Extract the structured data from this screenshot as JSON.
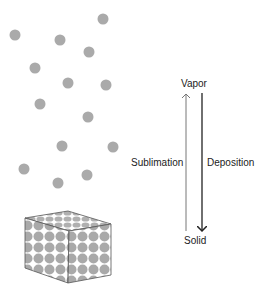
{
  "diagram": {
    "type": "phase-transition",
    "labels": {
      "top": "Vapor",
      "bottom": "Solid",
      "up_process": "Sublimation",
      "down_process": "Deposition"
    },
    "colors": {
      "particle": "#aaaaaa",
      "text": "#222222",
      "up_arrow": "#777777",
      "down_arrow": "#222222"
    },
    "vapor_particles": [
      [
        103,
        19
      ],
      [
        15,
        35
      ],
      [
        60,
        40
      ],
      [
        89,
        52
      ],
      [
        35,
        68
      ],
      [
        68,
        83
      ],
      [
        106,
        85
      ],
      [
        40,
        104
      ],
      [
        88,
        117
      ],
      [
        62,
        146
      ],
      [
        113,
        147
      ],
      [
        24,
        169
      ],
      [
        58,
        183
      ],
      [
        87,
        175
      ]
    ]
  }
}
